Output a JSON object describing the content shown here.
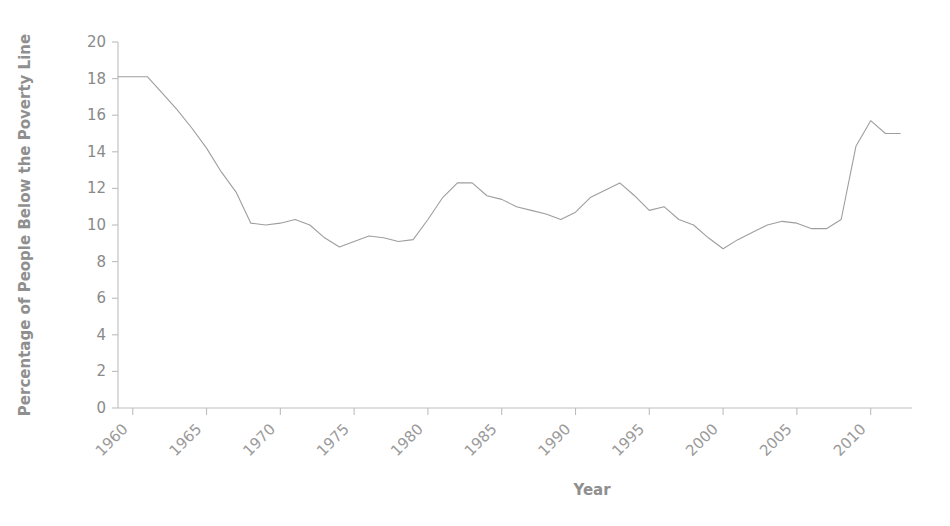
{
  "chart_data": {
    "type": "line",
    "title": "",
    "xlabel": "Year",
    "ylabel": "Percentage of People Below the Poverty Line",
    "xlim": [
      1959,
      2012.8
    ],
    "ylim": [
      0,
      20
    ],
    "grid": false,
    "legend": "none",
    "line_color": "#9e9e9e",
    "axis_color": "#bdbdbd",
    "text_color": "#8f8f8f",
    "xticks": [
      1960,
      1965,
      1970,
      1975,
      1980,
      1985,
      1990,
      1995,
      2000,
      2005,
      2010
    ],
    "xtick_labels": [
      "1960",
      "1965",
      "1970",
      "1975",
      "1980",
      "1985",
      "1990",
      "1995",
      "2000",
      "2005",
      "2010"
    ],
    "yticks": [
      0,
      2,
      4,
      6,
      8,
      10,
      12,
      14,
      16,
      18,
      20
    ],
    "ytick_labels": [
      "0",
      "2",
      "4",
      "6",
      "8",
      "10",
      "12",
      "14",
      "16",
      "18",
      "20"
    ],
    "x": [
      1959,
      1960,
      1961,
      1962,
      1963,
      1964,
      1965,
      1966,
      1967,
      1968,
      1969,
      1970,
      1971,
      1972,
      1973,
      1974,
      1975,
      1976,
      1977,
      1978,
      1979,
      1980,
      1981,
      1982,
      1983,
      1984,
      1985,
      1986,
      1987,
      1988,
      1989,
      1990,
      1991,
      1992,
      1993,
      1994,
      1995,
      1996,
      1997,
      1998,
      1999,
      2000,
      2001,
      2002,
      2003,
      2004,
      2005,
      2006,
      2007,
      2008,
      2009,
      2010,
      2011,
      2012
    ],
    "y": [
      18.1,
      18.1,
      18.1,
      17.2,
      16.3,
      15.3,
      14.2,
      12.9,
      11.8,
      10.1,
      10.0,
      10.1,
      10.3,
      10.0,
      9.3,
      8.8,
      9.1,
      9.4,
      9.3,
      9.1,
      9.2,
      10.3,
      11.5,
      12.3,
      12.3,
      11.6,
      11.4,
      11.0,
      10.8,
      10.6,
      10.3,
      10.7,
      11.5,
      11.9,
      12.3,
      11.6,
      10.8,
      11.0,
      10.3,
      10.0,
      9.3,
      8.7,
      9.2,
      9.6,
      10.0,
      10.2,
      10.1,
      9.8,
      9.8,
      10.3,
      14.3,
      15.7,
      15.0,
      15.0
    ]
  },
  "labels": {
    "x_axis_title": "Year",
    "y_axis_title": "Percentage of People Below the Poverty Line"
  }
}
